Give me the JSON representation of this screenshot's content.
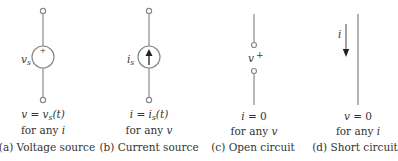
{
  "panels": [
    {
      "id": "a",
      "caption": "(a) Voltage source",
      "symbol_label": "v",
      "symbol_label_sub": "s",
      "symbol_mark": "+",
      "equation_lhs": "v",
      "equation_op": " = ",
      "equation_rhs": "v",
      "equation_rhs_sub": "s",
      "equation_rhs_tail": "(t)",
      "condition_prefix": "for any ",
      "condition_var": "i"
    },
    {
      "id": "b",
      "caption": "(b) Current source",
      "symbol_label": "i",
      "symbol_label_sub": "s",
      "equation_lhs": "i",
      "equation_op": " = ",
      "equation_rhs": "i",
      "equation_rhs_sub": "s",
      "equation_rhs_tail": "(t)",
      "condition_prefix": "for any ",
      "condition_var": "v"
    },
    {
      "id": "c",
      "caption": "(c) Open circuit",
      "symbol_label": "v",
      "symbol_mark": "+",
      "equation_lhs": "i",
      "equation_op": " = ",
      "equation_rhs": "0",
      "condition_prefix": "for any ",
      "condition_var": "v"
    },
    {
      "id": "d",
      "caption": "(d) Short circuit",
      "symbol_label": "i",
      "equation_lhs": "v",
      "equation_op": " = ",
      "equation_rhs": "0",
      "condition_prefix": "for any ",
      "condition_var": "i"
    }
  ],
  "colors": {
    "wire": "#8a8a8a",
    "text": "#333333",
    "background": "#ffffff"
  }
}
